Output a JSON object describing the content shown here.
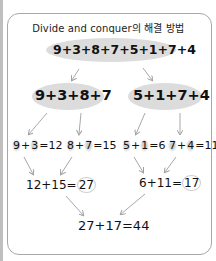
{
  "title": "Divide and conquer의 해결 방법",
  "level1": {
    "expression": "9+3+8+7+5+1+7+4"
  },
  "level2": {
    "left": "9+3+8+7",
    "right": "5+1+7+4"
  },
  "level3": [
    {
      "a": "9",
      "op": "+",
      "b": "3",
      "result": "=12"
    },
    {
      "a": "8",
      "op": "+",
      "b": "7",
      "result": "=15"
    },
    {
      "a": "5",
      "op": "+",
      "b": "1",
      "result": "=6"
    },
    {
      "a": "7",
      "op": "+",
      "b": "4",
      "result": "=11"
    }
  ],
  "level4": {
    "left": {
      "expr": "12+15=",
      "result": "27"
    },
    "right": {
      "expr": "6+11=",
      "result": "17"
    }
  },
  "level5": {
    "expression": "27+17=44"
  },
  "colors": {
    "frame_border": "#a8a8a8",
    "highlight": "#dcdcdc",
    "arrow": "#a0a0a0",
    "text": "#111111"
  }
}
